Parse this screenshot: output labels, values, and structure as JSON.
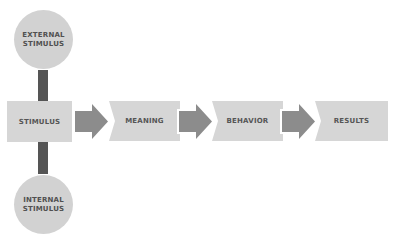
{
  "diagram": {
    "top_circle": {
      "label": "EXTERNAL STIMULUS"
    },
    "bottom_circle": {
      "label": "INTERNAL STIMULUS"
    },
    "flow": [
      {
        "label": "STIMULUS"
      },
      {
        "label": "MEANING"
      },
      {
        "label": "BEHAVIOR"
      },
      {
        "label": "RESULTS"
      }
    ],
    "colors": {
      "box": "#d6d6d6",
      "circle": "#d2d2d2",
      "arrow": "#8c8c8c",
      "connector": "#555555",
      "text": "#555555"
    }
  }
}
